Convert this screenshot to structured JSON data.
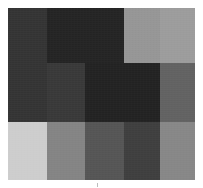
{
  "figure": {
    "title": "",
    "background_color": "#ffffff",
    "plot_area": {
      "x": 8,
      "y": 8,
      "width": 187,
      "height": 172
    }
  },
  "chart_data": {
    "type": "heatmap",
    "title": "",
    "xlabel": "",
    "ylabel": "",
    "grid": false,
    "legend": "none",
    "colormap": "grayscale",
    "xlim": [
      0,
      187
    ],
    "ylim": [
      0,
      172
    ],
    "x_tick_labels": [],
    "y_tick_labels": [],
    "columns": [
      {
        "index": 0,
        "x": 0,
        "width": 39
      },
      {
        "index": 1,
        "x": 39,
        "width": 38
      },
      {
        "index": 2,
        "x": 77,
        "width": 39
      },
      {
        "index": 3,
        "x": 116,
        "width": 36
      },
      {
        "index": 4,
        "x": 152,
        "width": 35
      }
    ],
    "rows": [
      {
        "index": 0,
        "y": 0,
        "height": 55
      },
      {
        "index": 1,
        "y": 55,
        "height": 59
      },
      {
        "index": 2,
        "y": 114,
        "height": 58
      }
    ],
    "cells": [
      {
        "row": 0,
        "col": 0,
        "x": 0,
        "y": 0,
        "w": 39,
        "h": 55,
        "value": 53,
        "color": "#353535"
      },
      {
        "row": 0,
        "col": 1,
        "x": 39,
        "y": 0,
        "w": 38,
        "h": 55,
        "value": 37,
        "color": "#252525"
      },
      {
        "row": 0,
        "col": 2,
        "x": 77,
        "y": 0,
        "w": 39,
        "h": 55,
        "value": 37,
        "color": "#252525"
      },
      {
        "row": 0,
        "col": 3,
        "x": 116,
        "y": 0,
        "w": 36,
        "h": 55,
        "value": 153,
        "color": "#999999"
      },
      {
        "row": 0,
        "col": 4,
        "x": 152,
        "y": 0,
        "w": 35,
        "h": 55,
        "value": 160,
        "color": "#a0a0a0"
      },
      {
        "row": 1,
        "col": 0,
        "x": 0,
        "y": 55,
        "w": 39,
        "h": 59,
        "value": 53,
        "color": "#353535"
      },
      {
        "row": 1,
        "col": 1,
        "x": 39,
        "y": 55,
        "w": 38,
        "h": 59,
        "value": 58,
        "color": "#3a3a3a"
      },
      {
        "row": 1,
        "col": 2,
        "x": 77,
        "y": 55,
        "w": 39,
        "h": 59,
        "value": 35,
        "color": "#232323"
      },
      {
        "row": 1,
        "col": 3,
        "x": 116,
        "y": 55,
        "w": 36,
        "h": 59,
        "value": 35,
        "color": "#232323"
      },
      {
        "row": 1,
        "col": 4,
        "x": 152,
        "y": 55,
        "w": 35,
        "h": 59,
        "value": 100,
        "color": "#646464"
      },
      {
        "row": 2,
        "col": 0,
        "x": 0,
        "y": 114,
        "w": 39,
        "h": 58,
        "value": 210,
        "color": "#d2d2d2"
      },
      {
        "row": 2,
        "col": 1,
        "x": 39,
        "y": 114,
        "w": 38,
        "h": 58,
        "value": 135,
        "color": "#878787"
      },
      {
        "row": 2,
        "col": 2,
        "x": 77,
        "y": 114,
        "w": 39,
        "h": 58,
        "value": 87,
        "color": "#575757"
      },
      {
        "row": 2,
        "col": 3,
        "x": 116,
        "y": 114,
        "w": 36,
        "h": 58,
        "value": 64,
        "color": "#404040"
      },
      {
        "row": 2,
        "col": 4,
        "x": 152,
        "y": 114,
        "w": 35,
        "h": 58,
        "value": 138,
        "color": "#8a8a8a"
      }
    ],
    "annotations": [
      {
        "name": "bottom-tick",
        "x": 97,
        "y": 183,
        "label": ""
      }
    ]
  }
}
